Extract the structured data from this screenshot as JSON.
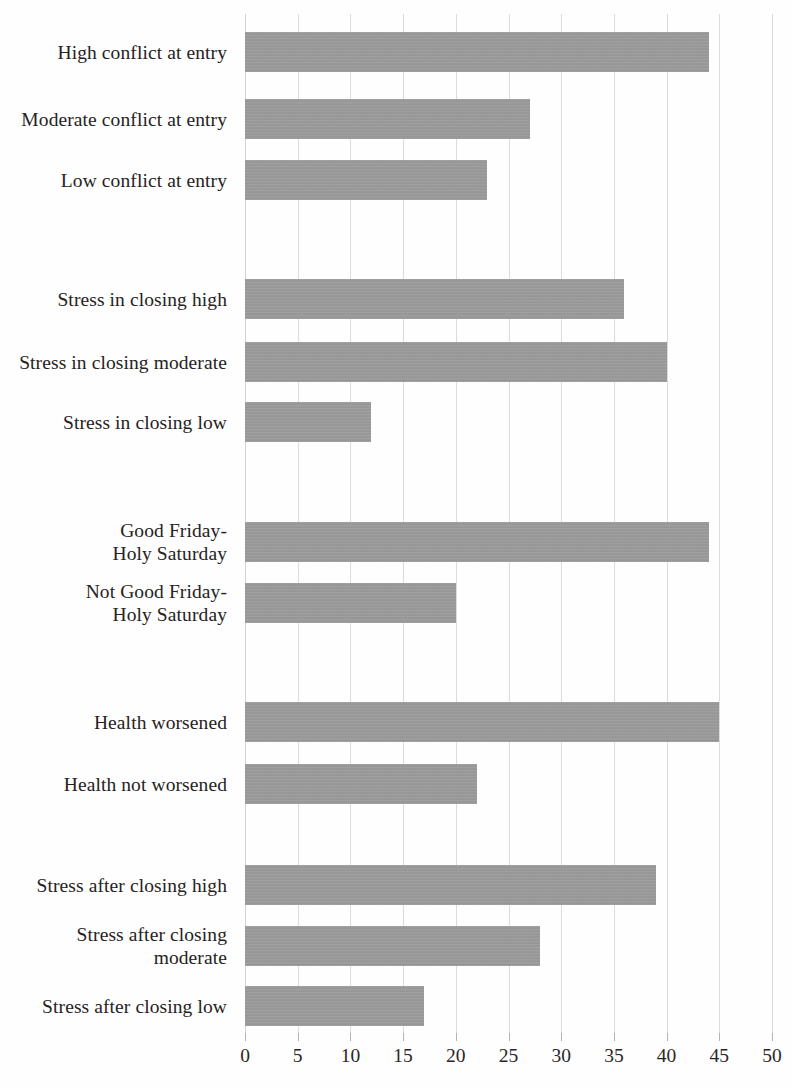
{
  "chart_data": {
    "type": "bar",
    "orientation": "horizontal",
    "title": "",
    "subtitle": "",
    "xlabel": "",
    "ylabel": "",
    "xlim": [
      0,
      50
    ],
    "ylim": null,
    "xticks": [
      0,
      5,
      10,
      15,
      20,
      25,
      30,
      35,
      40,
      45,
      50
    ],
    "xtick_labels": [
      "0",
      "5",
      "10",
      "15",
      "20",
      "25",
      "30",
      "35",
      "40",
      "45",
      "50"
    ],
    "grid": "vertical",
    "legend": null,
    "bar_color": "#9a9a9a",
    "categories": [
      "High conflict at entry",
      "Moderate conflict at entry",
      "Low conflict at entry",
      "Stress in closing high",
      "Stress in closing moderate",
      "Stress in closing low",
      "Good Friday-\nHoly Saturday",
      "Not Good Friday-\nHoly Saturday",
      "Health worsened",
      "Health not worsened",
      "Stress after closing high",
      "Stress after closing\nmoderate",
      "Stress after closing low"
    ],
    "values": [
      44,
      27,
      23,
      36,
      40,
      12,
      44,
      20,
      45,
      22,
      39,
      28,
      17
    ],
    "groups": [
      {
        "name": "conflict at entry",
        "categories": [
          "High conflict at entry",
          "Moderate conflict at entry",
          "Low conflict at entry"
        ],
        "values": [
          44,
          27,
          23
        ]
      },
      {
        "name": "stress in closing",
        "categories": [
          "Stress in closing high",
          "Stress in closing moderate",
          "Stress in closing low"
        ],
        "values": [
          36,
          40,
          12
        ]
      },
      {
        "name": "Good Friday-Holy Saturday",
        "categories": [
          "Good Friday-\nHoly Saturday",
          "Not Good Friday-\nHoly Saturday"
        ],
        "values": [
          44,
          20
        ]
      },
      {
        "name": "health",
        "categories": [
          "Health worsened",
          "Health not worsened"
        ],
        "values": [
          45,
          22
        ]
      },
      {
        "name": "stress after closing",
        "categories": [
          "Stress after closing high",
          "Stress after closing\nmoderate",
          "Stress after closing low"
        ],
        "values": [
          39,
          28,
          17
        ]
      }
    ],
    "bars": [
      {
        "label": "High conflict at entry",
        "value": 44,
        "top": 18,
        "height": 40
      },
      {
        "label": "Moderate conflict at entry",
        "value": 27,
        "top": 85,
        "height": 40
      },
      {
        "label": "Low conflict at entry",
        "value": 23,
        "top": 146,
        "height": 40
      },
      {
        "label": "Stress in closing high",
        "value": 36,
        "top": 265,
        "height": 40
      },
      {
        "label": "Stress in closing moderate",
        "value": 40,
        "top": 328,
        "height": 40
      },
      {
        "label": "Stress in closing low",
        "value": 12,
        "top": 388,
        "height": 40
      },
      {
        "label": "Good Friday-Holy Saturday",
        "value": 44,
        "top": 508,
        "height": 40
      },
      {
        "label": "Not Good Friday-Holy Saturday",
        "value": 20,
        "top": 569,
        "height": 40
      },
      {
        "label": "Health worsened",
        "value": 45,
        "top": 688,
        "height": 40
      },
      {
        "label": "Health not worsened",
        "value": 22,
        "top": 750,
        "height": 40
      },
      {
        "label": "Stress after closing high",
        "value": 39,
        "top": 851,
        "height": 40
      },
      {
        "label": "Stress after closing moderate",
        "value": 28,
        "top": 912,
        "height": 40
      },
      {
        "label": "Stress after closing low",
        "value": 17,
        "top": 972,
        "height": 40
      }
    ]
  },
  "labels": {
    "items": [
      {
        "text": "High conflict at entry",
        "center": 38
      },
      {
        "text": "Moderate conflict at entry",
        "center": 105
      },
      {
        "text": "Low conflict at entry",
        "center": 166
      },
      {
        "text": "Stress in closing high",
        "center": 285
      },
      {
        "text": "Stress in closing moderate",
        "center": 348
      },
      {
        "text": "Stress in closing low",
        "center": 408
      },
      {
        "text": "Good Friday-\nHoly Saturday",
        "center": 528
      },
      {
        "text": "Not Good Friday-\nHoly Saturday",
        "center": 589
      },
      {
        "text": "Health worsened",
        "center": 708
      },
      {
        "text": "Health not worsened",
        "center": 770
      },
      {
        "text": "Stress after closing high",
        "center": 871
      },
      {
        "text": "Stress after closing\nmoderate",
        "center": 932
      },
      {
        "text": "Stress after closing low",
        "center": 992
      }
    ]
  }
}
